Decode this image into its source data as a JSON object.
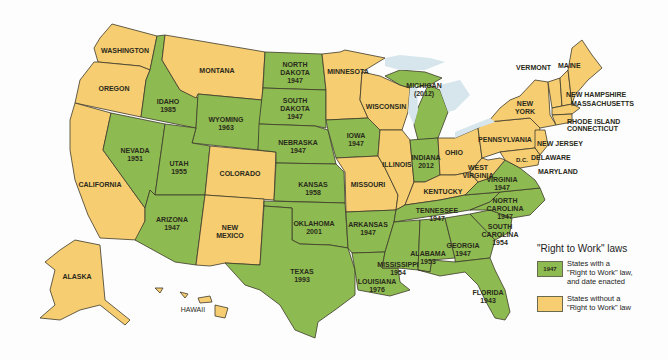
{
  "map": {
    "title": "\"Right to Work\" laws",
    "colors": {
      "right_to_work": "#8dbb52",
      "no_right_to_work": "#f7cd72",
      "border": "#3d3a2a",
      "lake": "#d6e6ec"
    },
    "states": [
      {
        "name": "WASHINGTON",
        "year": "",
        "status": "no"
      },
      {
        "name": "OREGON",
        "year": "",
        "status": "no"
      },
      {
        "name": "CALIFORNIA",
        "year": "",
        "status": "no"
      },
      {
        "name": "IDAHO",
        "year": "1985",
        "status": "rtw"
      },
      {
        "name": "NEVADA",
        "year": "1951",
        "status": "rtw"
      },
      {
        "name": "MONTANA",
        "year": "",
        "status": "no"
      },
      {
        "name": "WYOMING",
        "year": "1963",
        "status": "rtw"
      },
      {
        "name": "UTAH",
        "year": "1955",
        "status": "rtw"
      },
      {
        "name": "ARIZONA",
        "year": "1947",
        "status": "rtw"
      },
      {
        "name": "COLORADO",
        "year": "",
        "status": "no"
      },
      {
        "name": "NEW MEXICO",
        "year": "",
        "status": "no"
      },
      {
        "name": "NORTH DAKOTA",
        "year": "1947",
        "status": "rtw"
      },
      {
        "name": "SOUTH DAKOTA",
        "year": "1947",
        "status": "rtw"
      },
      {
        "name": "NEBRASKA",
        "year": "1947",
        "status": "rtw"
      },
      {
        "name": "KANSAS",
        "year": "1958",
        "status": "rtw"
      },
      {
        "name": "OKLAHOMA",
        "year": "2001",
        "status": "rtw"
      },
      {
        "name": "TEXAS",
        "year": "1993",
        "status": "rtw"
      },
      {
        "name": "MINNESOTA",
        "year": "",
        "status": "no"
      },
      {
        "name": "IOWA",
        "year": "1947",
        "status": "rtw"
      },
      {
        "name": "MISSOURI",
        "year": "",
        "status": "no"
      },
      {
        "name": "ARKANSAS",
        "year": "1947",
        "status": "rtw"
      },
      {
        "name": "LOUISIANA",
        "year": "1976",
        "status": "rtw"
      },
      {
        "name": "WISCONSIN",
        "year": "",
        "status": "no"
      },
      {
        "name": "ILLINOIS",
        "year": "",
        "status": "no"
      },
      {
        "name": "MICHIGAN",
        "year": "(2012)",
        "status": "rtw"
      },
      {
        "name": "INDIANA",
        "year": "2012",
        "status": "rtw"
      },
      {
        "name": "OHIO",
        "year": "",
        "status": "no"
      },
      {
        "name": "KENTUCKY",
        "year": "",
        "status": "no"
      },
      {
        "name": "TENNESSEE",
        "year": "1947",
        "status": "rtw"
      },
      {
        "name": "MISSISSIPPI",
        "year": "1954",
        "status": "rtw"
      },
      {
        "name": "ALABAMA",
        "year": "1953",
        "status": "rtw"
      },
      {
        "name": "GEORGIA",
        "year": "1947",
        "status": "rtw"
      },
      {
        "name": "FLORIDA",
        "year": "1943",
        "status": "rtw"
      },
      {
        "name": "SOUTH CAROLINA",
        "year": "1954",
        "status": "rtw"
      },
      {
        "name": "NORTH CAROLINA",
        "year": "1947",
        "status": "rtw"
      },
      {
        "name": "VIRGINIA",
        "year": "1947",
        "status": "rtw"
      },
      {
        "name": "WEST VIRGINIA",
        "year": "",
        "status": "no"
      },
      {
        "name": "PENNSYLVANIA",
        "year": "",
        "status": "no"
      },
      {
        "name": "NEW YORK",
        "year": "",
        "status": "no"
      },
      {
        "name": "VERMONT",
        "year": "",
        "status": "no"
      },
      {
        "name": "MAINE",
        "year": "",
        "status": "no"
      },
      {
        "name": "NEW HAMPSHIRE",
        "year": "",
        "status": "no"
      },
      {
        "name": "MASSACHUSETTS",
        "year": "",
        "status": "no"
      },
      {
        "name": "RHODE ISLAND",
        "year": "",
        "status": "no"
      },
      {
        "name": "CONNECTICUT",
        "year": "",
        "status": "no"
      },
      {
        "name": "NEW JERSEY",
        "year": "",
        "status": "no"
      },
      {
        "name": "DELAWARE",
        "year": "",
        "status": "no"
      },
      {
        "name": "MARYLAND",
        "year": "",
        "status": "no"
      },
      {
        "name": "D.C.",
        "year": "",
        "status": "no"
      },
      {
        "name": "ALASKA",
        "year": "",
        "status": "no"
      },
      {
        "name": "HAWAII",
        "year": "",
        "status": "no"
      }
    ],
    "labels": {
      "washington": "WASHINGTON",
      "oregon": "OREGON",
      "california": "CALIFORNIA",
      "idaho": "IDAHO\n1985",
      "nevada": "NEVADA\n1951",
      "montana": "MONTANA",
      "wyoming": "WYOMING\n1963",
      "utah": "UTAH\n1955",
      "arizona": "ARIZONA\n1947",
      "colorado": "COLORADO",
      "new_mexico": "NEW\nMEXICO",
      "north_dakota": "NORTH\nDAKOTA\n1947",
      "south_dakota": "SOUTH\nDAKOTA\n1947",
      "nebraska": "NEBRASKA\n1947",
      "kansas": "KANSAS\n1958",
      "oklahoma": "OKLAHOMA\n2001",
      "texas": "TEXAS\n1993",
      "minnesota": "MINNESOTA",
      "iowa": "IOWA\n1947",
      "missouri": "MISSOURI",
      "arkansas": "ARKANSAS\n1947",
      "louisiana": "LOUISIANA\n1976",
      "wisconsin": "WISCONSIN",
      "illinois": "ILLINOIS",
      "michigan": "MICHIGAN\n(2012)",
      "indiana": "INDIANA\n2012",
      "ohio": "OHIO",
      "kentucky": "KENTUCKY",
      "tennessee": "TENNESSEE\n1947",
      "mississippi": "MISSISSIPPI\n1954",
      "alabama": "ALABAMA\n1953",
      "georgia": "GEORGIA\n1947",
      "florida": "FLORIDA\n1943",
      "south_carolina": "SOUTH\nCAROLINA\n1954",
      "north_carolina": "NORTH\nCAROLINA\n1947",
      "virginia": "VIRGINIA\n1947",
      "west_virginia": "WEST\nVIRGINIA",
      "pennsylvania": "PENNSYLVANIA",
      "new_york": "NEW\nYORK",
      "vermont": "VERMONT",
      "maine": "MAINE",
      "new_hampshire": "NEW HAMPSHIRE",
      "massachusetts": "MASSACHUSETTS",
      "rhode_island": "RHODE ISLAND",
      "connecticut": "CONNECTICUT",
      "new_jersey": "NEW JERSEY",
      "delaware": "DELAWARE",
      "maryland": "MARYLAND",
      "dc": "D.C.",
      "alaska": "ALASKA",
      "hawaii": "HAWAII"
    }
  },
  "legend": {
    "title": "\"Right to Work\" laws",
    "items": [
      {
        "swatch_label": "1947",
        "text": "States with a\n\"Right to Work\" law,\nand date enacted",
        "color": "#8dbb52"
      },
      {
        "swatch_label": "",
        "text": "States without a\n\"Right to Work\" law",
        "color": "#f7cd72"
      }
    ]
  }
}
